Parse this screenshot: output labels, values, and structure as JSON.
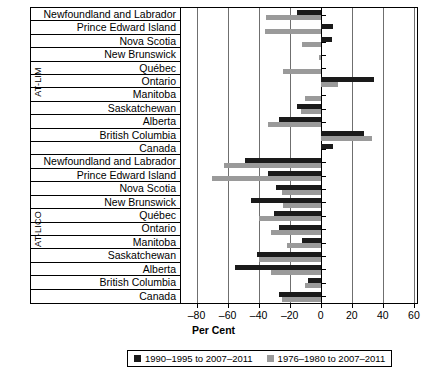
{
  "chart_data": {
    "type": "bar",
    "orientation": "horizontal",
    "title": "",
    "xlabel": "Per Cent",
    "ylabel": "",
    "xlim": [
      -90,
      62
    ],
    "xticks": [
      -80,
      -60,
      -40,
      -20,
      0,
      20,
      40,
      60
    ],
    "xticklabels": [
      "–80",
      "–60",
      "–40",
      "–20",
      "0",
      "20",
      "40",
      "60"
    ],
    "grid": true,
    "gridlines": [
      -80,
      -60,
      -40,
      -20,
      20,
      40,
      60
    ],
    "zero_line": 0,
    "legend_position": "bottom",
    "series": [
      {
        "name": "1990–1995 to 2007–2011",
        "color": "#1a1a1a",
        "key": "s1990"
      },
      {
        "name": "1976–1980 to 2007–2011",
        "color": "#9a9a9a",
        "key": "s1976"
      }
    ],
    "groups": [
      {
        "label": "AT-LIM",
        "categories": [
          "Newfoundland and Labrador",
          "Prince Edward Island",
          "Nova Scotia",
          "New Brunswick",
          "Québec",
          "Ontario",
          "Manitoba",
          "Saskatchewan",
          "Alberta",
          "British Columbia",
          "Canada"
        ],
        "s1990": [
          -15,
          8,
          7,
          0,
          0,
          34,
          0,
          -15,
          -27,
          28,
          8
        ],
        "s1976": [
          -35,
          -36,
          -12,
          -1,
          -24,
          11,
          -10,
          -13,
          -34,
          33,
          0
        ]
      },
      {
        "label": "AT-LICO",
        "categories": [
          "Newfoundland and Labrador",
          "Prince Edward Island",
          "Nova Scotia",
          "New Brunswick",
          "Québec",
          "Ontario",
          "Manitoba",
          "Saskatchewan",
          "Alberta",
          "British Columbia",
          "Canada"
        ],
        "s1990": [
          -49,
          -34,
          -29,
          -45,
          -30,
          -27,
          -12,
          -41,
          -55,
          -8,
          -27
        ],
        "s1976": [
          -62,
          -70,
          -25,
          -24,
          -40,
          -32,
          -22,
          -40,
          -32,
          -10,
          -25
        ]
      }
    ]
  },
  "axis": {
    "x_title": "Per Cent"
  },
  "legend": {
    "items": [
      {
        "label": "1990–1995 to 2007–2011",
        "color": "#1a1a1a"
      },
      {
        "label": "1976–1980 to 2007–2011",
        "color": "#9a9a9a"
      }
    ]
  }
}
